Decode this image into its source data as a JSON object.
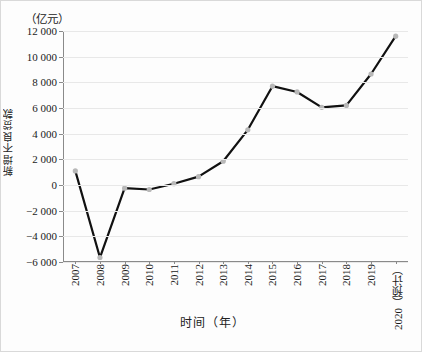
{
  "axes": {
    "unit_label": "（亿元）",
    "y_title": "新增不良贷款",
    "x_title": "时间（年）",
    "y_ticks": [
      "12 000",
      "10 000",
      "8 000",
      "6 000",
      "4 000",
      "2 000",
      "0",
      "−2 000",
      "−4 000",
      "−6 000"
    ]
  },
  "chart_data": {
    "type": "line",
    "title": "",
    "subtitle": "",
    "xlabel": "时间（年）",
    "ylabel": "新增不良贷款",
    "unit": "亿元",
    "categories": [
      "2007",
      "2008",
      "2009",
      "2010",
      "2011",
      "2012",
      "2013",
      "2014",
      "2015",
      "2016",
      "2017",
      "2018",
      "2019",
      "2020（预计）"
    ],
    "values": [
      1100,
      -5650,
      -250,
      -350,
      100,
      650,
      1850,
      4300,
      7700,
      7250,
      6050,
      6200,
      8650,
      11600
    ],
    "ylim": [
      -6000,
      12000
    ],
    "ytick_values": [
      12000,
      10000,
      8000,
      6000,
      4000,
      2000,
      0,
      -2000,
      -4000,
      -6000
    ],
    "grid": true,
    "legend": "none",
    "marker": "circle",
    "series_color": "#111111",
    "marker_color": "#b8b8b8",
    "grid_color": "#e8e8e8"
  }
}
